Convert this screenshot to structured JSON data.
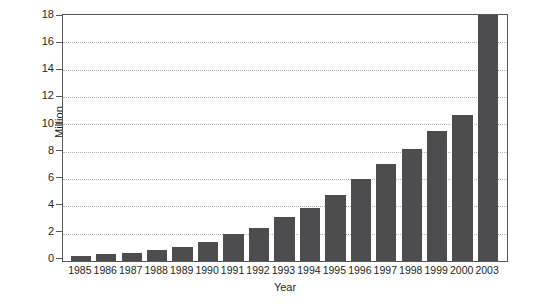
{
  "chart_data": {
    "type": "bar",
    "title": "",
    "xlabel": "Year",
    "ylabel": "Million",
    "categories": [
      "1985",
      "1986",
      "1987",
      "1988",
      "1989",
      "1990",
      "1991",
      "1992",
      "1993",
      "1994",
      "1995",
      "1996",
      "1997",
      "1998",
      "1999",
      "2000",
      "2003"
    ],
    "values": [
      0.4,
      0.5,
      0.6,
      0.8,
      1.05,
      1.4,
      1.95,
      2.4,
      3.2,
      3.9,
      4.8,
      6.0,
      7.1,
      8.2,
      9.5,
      10.7,
      18.0
    ],
    "ylim": [
      0,
      18
    ],
    "yticks": [
      0,
      2,
      4,
      6,
      8,
      10,
      12,
      14,
      16,
      18
    ],
    "ytick_labels": [
      "0",
      "2",
      "4",
      "6",
      "8",
      "10",
      "12",
      "14",
      "16",
      "18"
    ],
    "grid": true,
    "grid_axis": "y",
    "legend": false,
    "bar_color": "#4d4d4f",
    "axis_color": "#58595b",
    "grid_color": "#b3b3b3",
    "background": "#ffffff"
  }
}
